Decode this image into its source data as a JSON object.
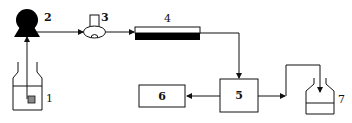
{
  "diagram": {
    "type": "flow-schematic",
    "components": [
      {
        "id": "1",
        "label": "1",
        "name": "sample-bottle"
      },
      {
        "id": "2",
        "label": "2",
        "name": "pump"
      },
      {
        "id": "3",
        "label": "3",
        "name": "injector"
      },
      {
        "id": "4",
        "label": "4",
        "name": "column"
      },
      {
        "id": "5",
        "label": "5",
        "name": "detector"
      },
      {
        "id": "6",
        "label": "6",
        "name": "recorder"
      },
      {
        "id": "7",
        "label": "7",
        "name": "waste-container"
      }
    ],
    "connections": [
      {
        "from": "1",
        "to": "2"
      },
      {
        "from": "2",
        "to": "3"
      },
      {
        "from": "3",
        "to": "4"
      },
      {
        "from": "4",
        "to": "5"
      },
      {
        "from": "5",
        "to": "6"
      },
      {
        "from": "5",
        "to": "7"
      }
    ],
    "colors": {
      "stroke": "#111111",
      "fill_dark": "#000000",
      "sample": "#8a8a8a",
      "background": "#ffffff"
    }
  }
}
